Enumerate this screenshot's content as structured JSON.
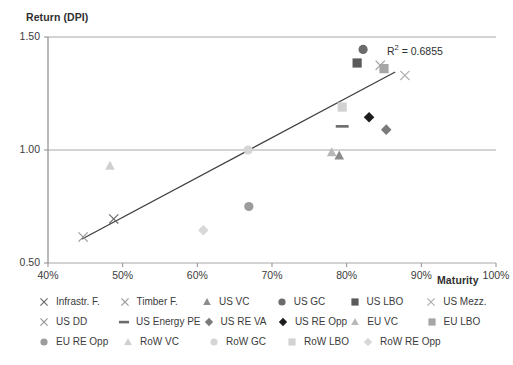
{
  "chart_data": {
    "type": "scatter",
    "title": "",
    "ylabel": "Return (DPI)",
    "xlabel": "Maturity",
    "xlim": [
      40,
      100
    ],
    "ylim": [
      0.5,
      1.5
    ],
    "xticks": [
      "40%",
      "50%",
      "60%",
      "70%",
      "80%",
      "90%",
      "100%"
    ],
    "xtick_values": [
      40,
      50,
      60,
      70,
      80,
      90,
      100
    ],
    "yticks": [
      "0.50",
      "1.00",
      "1.50"
    ],
    "ytick_values": [
      0.5,
      1.0,
      1.5
    ],
    "grid": "horizontal",
    "legend_position": "bottom",
    "annotations": [
      {
        "text": "R² = 0.6855",
        "x": 88.5,
        "y": 1.43
      }
    ],
    "trendline": {
      "label": "linear-trendline",
      "x": [
        44.5,
        86.5
      ],
      "y": [
        0.605,
        1.345
      ],
      "color": "#404040"
    },
    "series": [
      {
        "name": "Infrastr. F.",
        "marker": "x-thin",
        "color": "#6e6e6e",
        "x": 48.8,
        "y": 0.695
      },
      {
        "name": "Timber F.",
        "marker": "x-thin",
        "color": "#9a9a9a",
        "x": 44.7,
        "y": 0.615
      },
      {
        "name": "US VC",
        "marker": "triangle",
        "color": "#8c8c8c",
        "x": 79.0,
        "y": 0.975
      },
      {
        "name": "US GC",
        "marker": "circle",
        "color": "#6b6b6b",
        "x": 82.2,
        "y": 1.445
      },
      {
        "name": "US LBO",
        "marker": "square",
        "color": "#5a5a5a",
        "x": 81.4,
        "y": 1.385
      },
      {
        "name": "US Mezz.",
        "marker": "x-thin",
        "color": "#b0b0b0",
        "x": 87.8,
        "y": 1.33
      },
      {
        "name": "US DD",
        "marker": "x-thin",
        "color": "#9a9a9a",
        "x": 84.5,
        "y": 1.375
      },
      {
        "name": "US Energy PE",
        "marker": "dash",
        "color": "#6b6b6b",
        "x": 79.4,
        "y": 1.105
      },
      {
        "name": "US RE VA",
        "marker": "diamond",
        "color": "#7a7a7a",
        "x": 85.3,
        "y": 1.09
      },
      {
        "name": "EU LBO",
        "marker": "square",
        "color": "#a6a6a6",
        "x": 85.0,
        "y": 1.36
      },
      {
        "name": "US RE Opp",
        "marker": "diamond",
        "color": "#1c1c1c",
        "x": 83.0,
        "y": 1.145
      },
      {
        "name": "EU VC",
        "marker": "triangle",
        "color": "#b8b8b8",
        "x": 78.0,
        "y": 0.99
      },
      {
        "name": "EU RE Opp",
        "marker": "circle",
        "color": "#9c9c9c",
        "x": 66.9,
        "y": 0.75
      },
      {
        "name": "RoW VC",
        "marker": "triangle",
        "color": "#cfcfcf",
        "x": 48.3,
        "y": 0.93
      },
      {
        "name": "RoW GC",
        "marker": "circle",
        "color": "#d5d5d5",
        "x": 66.8,
        "y": 1.0
      },
      {
        "name": "RoW LBO",
        "marker": "square",
        "color": "#d2d2d2",
        "x": 79.4,
        "y": 1.19
      },
      {
        "name": "RoW RE Opp",
        "marker": "diamond",
        "color": "#d8d8d8",
        "x": 60.8,
        "y": 0.645
      }
    ]
  },
  "axis": {
    "y_title": "Return (DPI)",
    "x_title": "Maturity",
    "y_labels": [
      "1.50",
      "1.00",
      "0.50"
    ],
    "x_labels": [
      "40%",
      "50%",
      "60%",
      "70%",
      "80%",
      "90%",
      "100%"
    ]
  },
  "annotation": {
    "r2_prefix": "R",
    "r2_sup": "2",
    "r2_value": " = 0.6855"
  },
  "legend": {
    "rows": [
      [
        {
          "label": "Infrastr. F.",
          "marker": "x-thin",
          "color": "#6e6e6e"
        },
        {
          "label": "Timber F.",
          "marker": "x-thin",
          "color": "#9a9a9a"
        },
        {
          "label": "US VC",
          "marker": "triangle",
          "color": "#8c8c8c"
        },
        {
          "label": "US GC",
          "marker": "circle",
          "color": "#6b6b6b"
        },
        {
          "label": "US LBO",
          "marker": "square",
          "color": "#5a5a5a"
        },
        {
          "label": "US Mezz.",
          "marker": "x-thin",
          "color": "#b0b0b0"
        }
      ],
      [
        {
          "label": "US DD",
          "marker": "x-thin",
          "color": "#9a9a9a"
        },
        {
          "label": "US Energy PE",
          "marker": "dash",
          "color": "#6b6b6b"
        },
        {
          "label": "US RE VA",
          "marker": "diamond",
          "color": "#7a7a7a"
        },
        {
          "label": "US RE Opp",
          "marker": "diamond",
          "color": "#1c1c1c"
        },
        {
          "label": "EU VC",
          "marker": "triangle",
          "color": "#b8b8b8"
        },
        {
          "label": "EU LBO",
          "marker": "square",
          "color": "#a6a6a6"
        }
      ],
      [
        {
          "label": "EU RE Opp",
          "marker": "circle",
          "color": "#9c9c9c"
        },
        {
          "label": "RoW VC",
          "marker": "triangle",
          "color": "#cfcfcf"
        },
        {
          "label": "RoW GC",
          "marker": "circle",
          "color": "#d5d5d5"
        },
        {
          "label": "RoW LBO",
          "marker": "square",
          "color": "#d2d2d2"
        },
        {
          "label": "RoW RE Opp",
          "marker": "diamond",
          "color": "#d8d8d8"
        }
      ]
    ]
  },
  "colors": {
    "axis_line": "#8c8c8c",
    "grid_line": "#a8a8a8",
    "trend_line": "#404040",
    "text": "#3b3b3b"
  }
}
